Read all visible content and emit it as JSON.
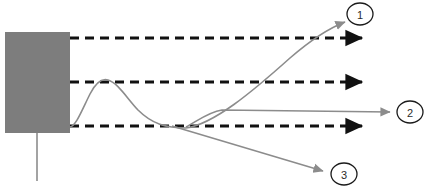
{
  "diagram": {
    "canvas": {
      "width": 430,
      "height": 193,
      "background": "#ffffff"
    },
    "block": {
      "name": "gray-block",
      "fill": "#7d7d7d",
      "x": 5,
      "y": 32,
      "width": 65,
      "height": 101
    },
    "leader_line": {
      "name": "block-leader-line",
      "color": "#8c8c8c",
      "x": 37,
      "y_start": 133,
      "y_end": 181
    },
    "dashed_arrows": {
      "color": "#111111",
      "dash_pattern": "9 6",
      "stroke_width": 3.2,
      "x_start": 70,
      "x_end": 368,
      "rows": [
        {
          "name": "dashed-arrow-top",
          "y": 38
        },
        {
          "name": "dashed-arrow-middle",
          "y": 82
        },
        {
          "name": "dashed-arrow-bottom",
          "y": 126
        }
      ]
    },
    "curve": {
      "name": "response-curve",
      "color": "#8c8c8c",
      "stroke_width": 1.6,
      "description": "rises from block edge, peaks near the middle dashed line, falls to the bottom dashed line"
    },
    "branches": [
      {
        "name": "branch-to-callout-1",
        "color": "#8c8c8c",
        "target": "1",
        "from": {
          "x": 186,
          "y": 128
        },
        "to": {
          "x": 347,
          "y": 22
        }
      },
      {
        "name": "branch-to-callout-2",
        "color": "#8c8c8c",
        "target": "2",
        "from": {
          "x": 222,
          "y": 110
        },
        "to": {
          "x": 393,
          "y": 112
        }
      },
      {
        "name": "branch-to-callout-3",
        "color": "#8c8c8c",
        "target": "3",
        "from": {
          "x": 172,
          "y": 126
        },
        "to": {
          "x": 326,
          "y": 172
        }
      }
    ],
    "callouts": [
      {
        "name": "callout-1",
        "label": "1",
        "cx": 360,
        "cy": 14,
        "rx": 13,
        "ry": 11
      },
      {
        "name": "callout-2",
        "label": "2",
        "cx": 410,
        "cy": 112,
        "rx": 13,
        "ry": 11
      },
      {
        "name": "callout-3",
        "label": "3",
        "cx": 344,
        "cy": 174,
        "rx": 13,
        "ry": 11
      }
    ],
    "colors": {
      "block_gray": "#7d7d7d",
      "line_gray": "#8c8c8c",
      "dash_black": "#111111",
      "callout_stroke": "#1a1a1a",
      "label_text": "#2b2b2b"
    }
  }
}
